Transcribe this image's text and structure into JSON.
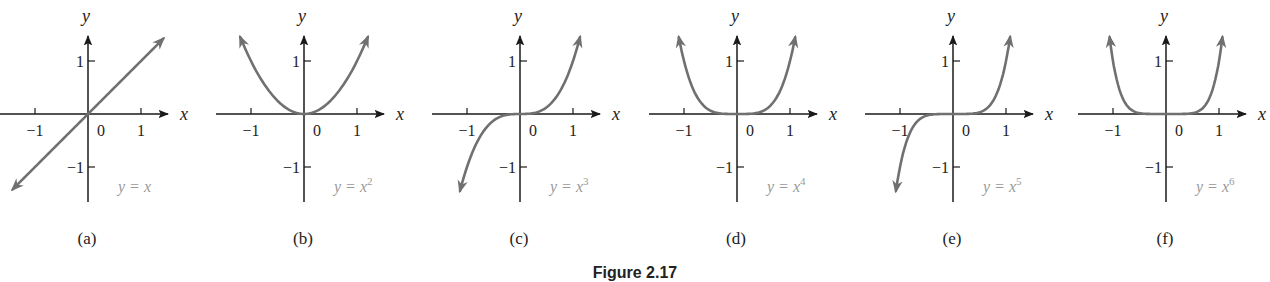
{
  "figure": {
    "caption": "Figure 2.17"
  },
  "colors": {
    "axis": "#1a1a1a",
    "curve": "#707070",
    "label": "#9a9a9a",
    "text": "#222222"
  },
  "chart_data": [
    {
      "type": "line",
      "panel": "(a)",
      "title": "y = x",
      "function": "x",
      "exponent": 1,
      "xlabel": "x",
      "ylabel": "y",
      "x_ticks": [
        -1,
        0,
        1
      ],
      "y_ticks": [
        -1,
        1
      ],
      "xlim": [
        -1.4,
        1.4
      ],
      "ylim": [
        -1.4,
        1.4
      ],
      "grid": false,
      "x": [
        -1.4,
        -1,
        -0.5,
        0,
        0.5,
        1,
        1.4
      ],
      "values": [
        -1.4,
        -1,
        -0.5,
        0,
        0.5,
        1,
        1.4
      ]
    },
    {
      "type": "line",
      "panel": "(b)",
      "title": "y = x²",
      "function": "x^2",
      "exponent": 2,
      "xlabel": "x",
      "ylabel": "y",
      "x_ticks": [
        -1,
        0,
        1
      ],
      "y_ticks": [
        -1,
        1
      ],
      "xlim": [
        -1.4,
        1.4
      ],
      "ylim": [
        -1.4,
        1.4
      ],
      "grid": false,
      "x": [
        -1.2,
        -1,
        -0.5,
        0,
        0.5,
        1,
        1.2
      ],
      "values": [
        1.44,
        1,
        0.25,
        0,
        0.25,
        1,
        1.44
      ]
    },
    {
      "type": "line",
      "panel": "(c)",
      "title": "y = x³",
      "function": "x^3",
      "exponent": 3,
      "xlabel": "x",
      "ylabel": "y",
      "x_ticks": [
        -1,
        0,
        1
      ],
      "y_ticks": [
        -1,
        1
      ],
      "xlim": [
        -1.4,
        1.4
      ],
      "ylim": [
        -1.4,
        1.4
      ],
      "grid": false,
      "x": [
        -1.13,
        -1,
        -0.5,
        0,
        0.5,
        1,
        1.13
      ],
      "values": [
        -1.44,
        -1,
        -0.125,
        0,
        0.125,
        1,
        1.44
      ]
    },
    {
      "type": "line",
      "panel": "(d)",
      "title": "y = x⁴",
      "function": "x^4",
      "exponent": 4,
      "xlabel": "x",
      "ylabel": "y",
      "x_ticks": [
        -1,
        0,
        1
      ],
      "y_ticks": [
        -1,
        1
      ],
      "xlim": [
        -1.4,
        1.4
      ],
      "ylim": [
        -1.4,
        1.4
      ],
      "grid": false,
      "x": [
        -1.1,
        -1,
        -0.5,
        0,
        0.5,
        1,
        1.1
      ],
      "values": [
        1.46,
        1,
        0.0625,
        0,
        0.0625,
        1,
        1.46
      ]
    },
    {
      "type": "line",
      "panel": "(e)",
      "title": "y = x⁵",
      "function": "x^5",
      "exponent": 5,
      "xlabel": "x",
      "ylabel": "y",
      "x_ticks": [
        -1,
        0,
        1
      ],
      "y_ticks": [
        -1,
        1
      ],
      "xlim": [
        -1.4,
        1.4
      ],
      "ylim": [
        -1.4,
        1.4
      ],
      "grid": false,
      "x": [
        -1.08,
        -1,
        -0.5,
        0,
        0.5,
        1,
        1.08
      ],
      "values": [
        -1.47,
        -1,
        -0.03,
        0,
        0.03,
        1,
        1.47
      ]
    },
    {
      "type": "line",
      "panel": "(f)",
      "title": "y = x⁶",
      "function": "x^6",
      "exponent": 6,
      "xlabel": "x",
      "ylabel": "y",
      "x_ticks": [
        -1,
        0,
        1
      ],
      "y_ticks": [
        -1,
        1
      ],
      "xlim": [
        -1.4,
        1.4
      ],
      "ylim": [
        -1.4,
        1.4
      ],
      "grid": false,
      "x": [
        -1.06,
        -1,
        -0.5,
        0,
        0.5,
        1,
        1.06
      ],
      "values": [
        1.42,
        1,
        0.016,
        0,
        0.016,
        1,
        1.42
      ]
    }
  ],
  "panels": [
    {
      "id": "a",
      "label": "(a)",
      "eq_base": "y = x",
      "eq_sup": "",
      "ox": 88,
      "n": 1
    },
    {
      "id": "b",
      "label": "(b)",
      "eq_base": "y = x",
      "eq_sup": "2",
      "ox": 304,
      "n": 2
    },
    {
      "id": "c",
      "label": "(c)",
      "eq_base": "y = x",
      "eq_sup": "3",
      "ox": 520,
      "n": 3
    },
    {
      "id": "d",
      "label": "(d)",
      "eq_base": "y = x",
      "eq_sup": "4",
      "ox": 737,
      "n": 4
    },
    {
      "id": "e",
      "label": "(e)",
      "eq_base": "y = x",
      "eq_sup": "5",
      "ox": 953,
      "n": 5
    },
    {
      "id": "f",
      "label": "(f)",
      "eq_base": "y = x",
      "eq_sup": "6",
      "ox": 1166,
      "n": 6
    }
  ],
  "axis_labels": {
    "x": "x",
    "y": "y",
    "tick_neg1": "−1",
    "tick_0": "0",
    "tick_1": "1"
  }
}
